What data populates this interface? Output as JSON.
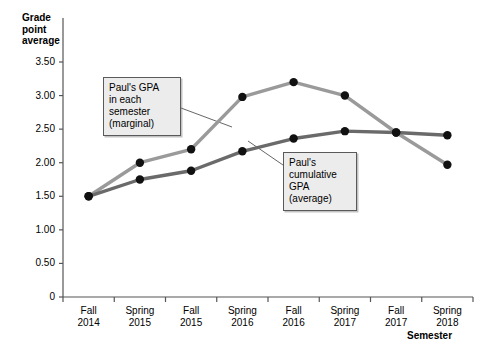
{
  "chart_data": {
    "type": "line",
    "title": "",
    "xlabel": "Semester",
    "ylabel": "Grade point average",
    "ylim": [
      0,
      3.75
    ],
    "grid": false,
    "legend_position": "annotations",
    "categories": [
      "Fall\n2014",
      "Spring\n2015",
      "Fall\n2015",
      "Spring\n2016",
      "Fall\n2016",
      "Spring\n2017",
      "Fall\n2017",
      "Spring\n2018"
    ],
    "ytick_labels": [
      "0",
      "0.50",
      "1.00",
      "1.50",
      "2.00",
      "2.50",
      "3.00",
      "3.50"
    ],
    "ytick_values": [
      0,
      0.5,
      1.0,
      1.5,
      2.0,
      2.5,
      3.0,
      3.5
    ],
    "series": [
      {
        "name": "Paul's GPA in each semester (marginal)",
        "color": "#9a9a9a",
        "values": [
          1.5,
          2.0,
          2.2,
          2.98,
          3.2,
          3.0,
          2.45,
          1.97
        ]
      },
      {
        "name": "Paul's cumulative GPA (average)",
        "color": "#6a6a6a",
        "values": [
          1.5,
          1.75,
          1.88,
          2.17,
          2.36,
          2.47,
          2.45,
          2.41
        ]
      }
    ],
    "annotations": [
      {
        "id": "marginal",
        "text": "Paul's GPA\nin each\nsemester\n(marginal)",
        "points_to_series": "Paul's GPA in each semester (marginal)",
        "points_to_index": 3
      },
      {
        "id": "cumulative",
        "text": "Paul's\ncumulative\nGPA\n(average)",
        "points_to_series": "Paul's cumulative GPA (average)",
        "points_to_index": 3
      }
    ]
  },
  "axis": {
    "y_title": "Grade\npoint\naverage",
    "x_title": "Semester"
  },
  "colors": {
    "marginal_line": "#9a9a9a",
    "cumulative_line": "#6a6a6a",
    "marker": "#111111",
    "axis": "#555555",
    "callout_bg": "#ececec",
    "callout_border": "#5a5a5a"
  },
  "decor": {
    "bleed_through": ""
  }
}
